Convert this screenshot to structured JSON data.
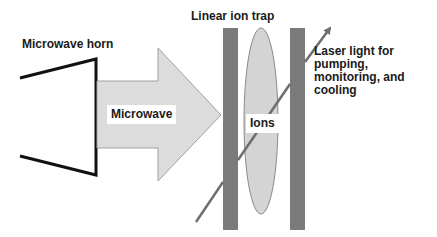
{
  "labels": {
    "horn": "Microwave horn",
    "trap": "Linear ion trap",
    "microwave": "Microwave",
    "ions": "Ions",
    "laser": "Laser light for pumping, monitoring, and cooling"
  },
  "colors": {
    "horn_stroke": "#111111",
    "arrow_fill": "#dcdcdc",
    "arrow_stroke": "#9a9a9a",
    "electrode": "#7a7a7a",
    "ion_cloud_fill": "#d4d4d4",
    "ion_cloud_stroke": "#8a8a8a",
    "laser": "#6e6e6e",
    "text": "#1a1a1a"
  }
}
